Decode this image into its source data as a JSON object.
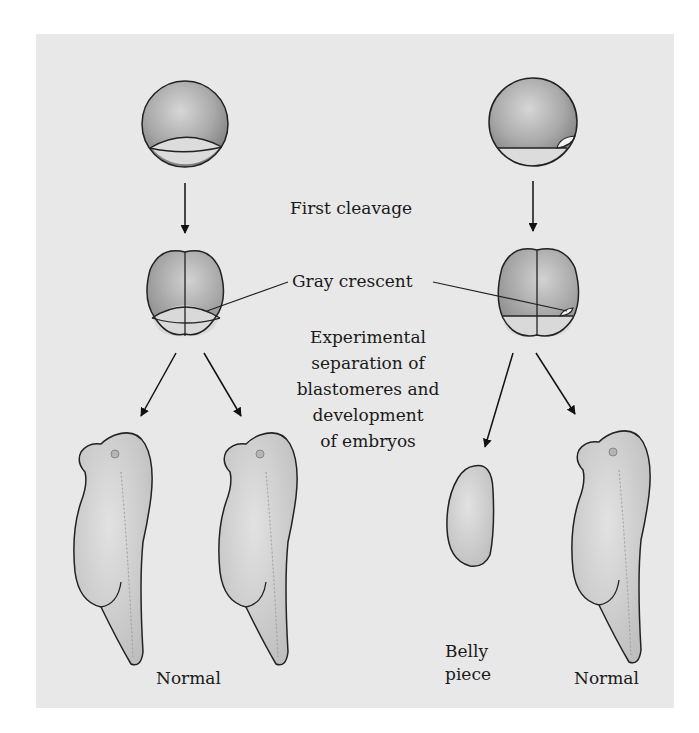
{
  "figure": {
    "labels": {
      "first_cleavage": "First cleavage",
      "gray_crescent": "Gray crescent",
      "experiment": "Experimental\nseparation of\nblastomeres and\ndevelopment\nof embryos",
      "left_outcome": "Normal",
      "right_outcome_belly": "Belly\npiece",
      "right_outcome_normal": "Normal"
    },
    "colors": {
      "panel_bg": "#e8e8e8",
      "animal_pole": "#9a9a9a",
      "vegetal_pole": "#d8d8d8",
      "outline": "#222222",
      "embryo_fill": "#cfcfcf"
    }
  }
}
